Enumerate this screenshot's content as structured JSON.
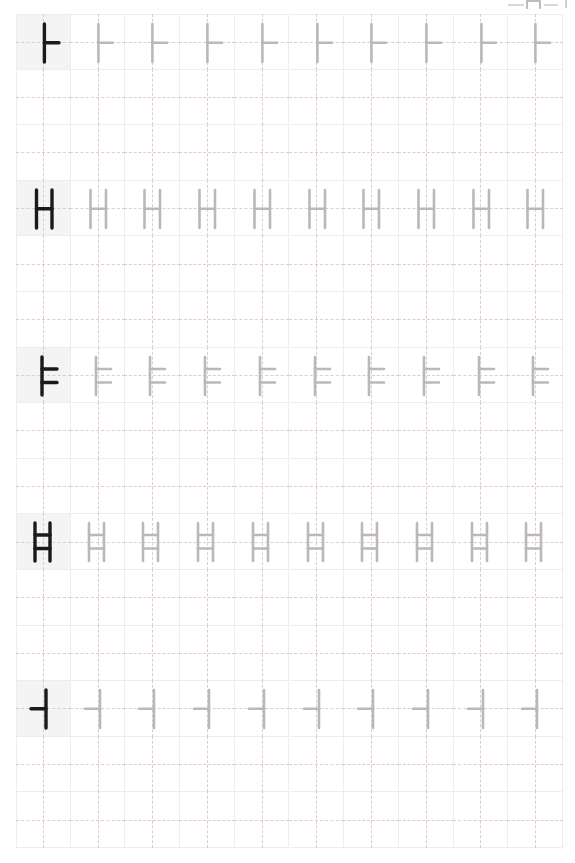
{
  "page": {
    "width": 575,
    "height": 863,
    "background_color": "#ffffff"
  },
  "top_artifact": {
    "description": "cropped toolbar remnant at top-right edge",
    "color": "#cfcfcf"
  },
  "grid": {
    "origin_x": 16,
    "origin_y": 14,
    "columns": 10,
    "rows": 15,
    "cell_width": 54.7,
    "cell_height": 55.6,
    "line_color": "#ededed",
    "guide_color": "#e3c9cd",
    "guide_style": "dashed crosshair",
    "model_cell_background": "#f4f4f4",
    "model_stroke_color": "#1a1a1a",
    "trace_stroke_color": "#b9b9b9"
  },
  "practice_rows": [
    {
      "grid_row_index": 0,
      "character": "ㅏ",
      "romanization": "a",
      "unicode": "U+314F",
      "repetitions": 10,
      "model_column": 0,
      "strokes": [
        {
          "name": "vertical-stem",
          "x1": 27.4,
          "y1": 9,
          "x2": 27.4,
          "y2": 47
        },
        {
          "name": "right-branch",
          "x1": 27.4,
          "y1": 27.8,
          "x2": 42,
          "y2": 27.8
        }
      ]
    },
    {
      "grid_row_index": 3,
      "character": "ㅐ",
      "romanization": "ae",
      "unicode": "U+3150",
      "repetitions": 10,
      "model_column": 0,
      "strokes": [
        {
          "name": "left-stem",
          "x1": 19.5,
          "y1": 9,
          "x2": 19.5,
          "y2": 47
        },
        {
          "name": "middle-branch",
          "x1": 19.5,
          "y1": 27.8,
          "x2": 35,
          "y2": 27.8
        },
        {
          "name": "right-stem",
          "x1": 35,
          "y1": 9,
          "x2": 35,
          "y2": 47
        }
      ]
    },
    {
      "grid_row_index": 6,
      "character": "ㅑ",
      "romanization": "ya",
      "unicode": "U+3151",
      "repetitions": 10,
      "model_column": 0,
      "strokes": [
        {
          "name": "vertical-stem",
          "x1": 25,
          "y1": 9,
          "x2": 25,
          "y2": 47
        },
        {
          "name": "upper-branch",
          "x1": 25,
          "y1": 21,
          "x2": 40,
          "y2": 21
        },
        {
          "name": "lower-branch",
          "x1": 25,
          "y1": 34.5,
          "x2": 40,
          "y2": 34.5
        }
      ]
    },
    {
      "grid_row_index": 9,
      "character": "ㅒ",
      "romanization": "yae",
      "unicode": "U+3152",
      "repetitions": 10,
      "model_column": 0,
      "strokes": [
        {
          "name": "left-stem",
          "x1": 18,
          "y1": 9,
          "x2": 18,
          "y2": 47
        },
        {
          "name": "upper-branch",
          "x1": 18,
          "y1": 21,
          "x2": 33,
          "y2": 21
        },
        {
          "name": "lower-branch",
          "x1": 18,
          "y1": 34.5,
          "x2": 33,
          "y2": 34.5
        },
        {
          "name": "right-stem",
          "x1": 33,
          "y1": 9,
          "x2": 33,
          "y2": 47
        }
      ]
    },
    {
      "grid_row_index": 12,
      "character": "ㅓ",
      "romanization": "eo",
      "unicode": "U+3153",
      "repetitions": 10,
      "model_column": 0,
      "strokes": [
        {
          "name": "left-branch",
          "x1": 14,
          "y1": 27.8,
          "x2": 29,
          "y2": 27.8
        },
        {
          "name": "vertical-stem",
          "x1": 29,
          "y1": 9,
          "x2": 29,
          "y2": 47
        }
      ]
    }
  ]
}
